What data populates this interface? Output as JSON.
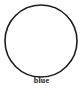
{
  "figure": {
    "background_color": "#ffffff",
    "width": 83,
    "height": 90,
    "shape": {
      "icon_name": "circle-outline-icon",
      "kind": "circle",
      "filled": false,
      "stroke_color": "#1c1c1c",
      "fill_color": "none",
      "stroke_width": 1.6,
      "center_x": 41,
      "center_y": 41,
      "radius": 36
    },
    "label": {
      "text": "blue",
      "color": "#1a1a1a",
      "bold": true
    }
  }
}
